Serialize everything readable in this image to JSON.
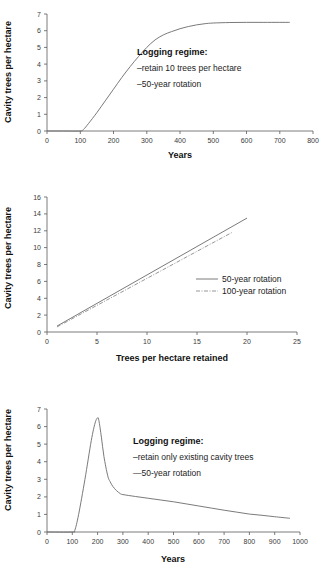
{
  "figure": {
    "panels": [
      {
        "id": "panel-1",
        "xlabel": "Years",
        "ylabel": "Cavity trees per hectare",
        "annotation": {
          "heading": "Logging regime:",
          "line1": "–retain 10 trees per hectare",
          "line2": "–50-year rotation"
        },
        "xticks": [
          "0",
          "100",
          "200",
          "300",
          "400",
          "500",
          "600",
          "700",
          "800"
        ],
        "yticks": [
          "0",
          "1",
          "2",
          "3",
          "4",
          "5",
          "6",
          "7"
        ]
      },
      {
        "id": "panel-2",
        "xlabel": "Trees per hectare retained",
        "ylabel": "Cavity trees per hectare",
        "legend": {
          "item1": "50-year rotation",
          "item2": "100-year rotation"
        },
        "xticks": [
          "0",
          "5",
          "10",
          "15",
          "20",
          "25"
        ],
        "yticks": [
          "0",
          "2",
          "4",
          "6",
          "8",
          "10",
          "12",
          "14",
          "16"
        ]
      },
      {
        "id": "panel-3",
        "xlabel": "Years",
        "ylabel": "Cavity trees per hectare",
        "annotation": {
          "heading": "Logging regime:",
          "line1": "–retain only existing cavity trees",
          "line2": "—50-year rotation"
        },
        "xticks": [
          "0",
          "100",
          "200",
          "300",
          "400",
          "500",
          "600",
          "700",
          "800",
          "900",
          "1000"
        ],
        "yticks": [
          "0",
          "1",
          "2",
          "3",
          "4",
          "5",
          "6",
          "7"
        ]
      }
    ]
  },
  "chart_data": [
    {
      "type": "line",
      "panel": "panel-1",
      "title": "",
      "xlabel": "Years",
      "ylabel": "Cavity trees per hectare",
      "xlim": [
        0,
        800
      ],
      "ylim": [
        0,
        7
      ],
      "xticks": [
        0,
        100,
        200,
        300,
        400,
        500,
        600,
        700,
        800
      ],
      "yticks": [
        0,
        1,
        2,
        3,
        4,
        5,
        6,
        7
      ],
      "grid": false,
      "legend": null,
      "annotations": [
        "Logging regime:",
        "–retain 10 trees per hectare",
        "–50-year rotation"
      ],
      "series": [
        {
          "name": "retain 10 trees per hectare, 50-year rotation",
          "style": "solid",
          "x": [
            0,
            50,
            100,
            110,
            125,
            150,
            175,
            200,
            225,
            250,
            275,
            300,
            325,
            350,
            375,
            400,
            425,
            450,
            475,
            500,
            550,
            600,
            650,
            700,
            730
          ],
          "y": [
            0,
            0,
            0,
            0.1,
            0.45,
            1.1,
            1.8,
            2.5,
            3.2,
            3.85,
            4.45,
            5.0,
            5.45,
            5.75,
            5.95,
            6.12,
            6.25,
            6.35,
            6.42,
            6.46,
            6.49,
            6.5,
            6.5,
            6.5,
            6.5
          ]
        }
      ]
    },
    {
      "type": "line",
      "panel": "panel-2",
      "title": "",
      "xlabel": "Trees per hectare retained",
      "ylabel": "Cavity trees per hectare",
      "xlim": [
        0,
        25
      ],
      "ylim": [
        0,
        16
      ],
      "xticks": [
        0,
        5,
        10,
        15,
        20,
        25
      ],
      "yticks": [
        0,
        2,
        4,
        6,
        8,
        10,
        12,
        14,
        16
      ],
      "grid": false,
      "legend_position": "right",
      "series": [
        {
          "name": "50-year rotation",
          "style": "solid",
          "x": [
            1,
            20
          ],
          "y": [
            0.7,
            13.5
          ]
        },
        {
          "name": "100-year rotation",
          "style": "dash-dot",
          "x": [
            1,
            18.5
          ],
          "y": [
            0.6,
            11.8
          ]
        }
      ]
    },
    {
      "type": "line",
      "panel": "panel-3",
      "title": "",
      "xlabel": "Years",
      "ylabel": "Cavity trees per hectare",
      "xlim": [
        0,
        1000
      ],
      "ylim": [
        0,
        7
      ],
      "xticks": [
        0,
        100,
        200,
        300,
        400,
        500,
        600,
        700,
        800,
        900,
        1000
      ],
      "yticks": [
        0,
        1,
        2,
        3,
        4,
        5,
        6,
        7
      ],
      "grid": false,
      "legend": null,
      "annotations": [
        "Logging regime:",
        "–retain only existing cavity trees",
        "—50-year rotation"
      ],
      "series": [
        {
          "name": "retain only existing cavity trees, 50-year rotation",
          "style": "solid",
          "x": [
            0,
            100,
            110,
            125,
            150,
            175,
            190,
            200,
            205,
            215,
            225,
            240,
            250,
            260,
            275,
            290,
            300,
            350,
            400,
            450,
            500,
            550,
            600,
            650,
            700,
            750,
            800,
            850,
            900,
            960
          ],
          "y": [
            0,
            0,
            0.1,
            1.0,
            3.0,
            5.2,
            6.2,
            6.5,
            6.35,
            5.4,
            4.3,
            3.2,
            2.85,
            2.6,
            2.35,
            2.18,
            2.13,
            2.02,
            1.92,
            1.82,
            1.72,
            1.6,
            1.48,
            1.36,
            1.24,
            1.13,
            1.02,
            0.95,
            0.87,
            0.78
          ]
        }
      ]
    }
  ]
}
